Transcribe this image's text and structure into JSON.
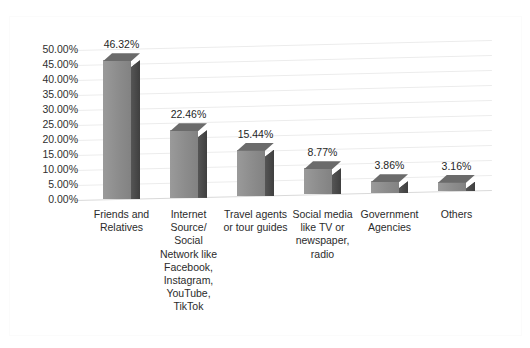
{
  "chart_data": {
    "type": "bar",
    "title": "",
    "subtitle": "",
    "xlabel": "",
    "ylabel": "",
    "categories": [
      "Friends and Relatives",
      "Internet Source/ Social Network like Facebook, Instagram, YouTube, TikTok",
      "Travel agents or tour guides",
      "Social media like TV or newspaper, radio",
      "Government Agencies",
      "Others"
    ],
    "values": [
      46.32,
      22.46,
      15.44,
      8.77,
      3.86,
      3.16
    ],
    "data_labels": [
      "46.32%",
      "22.46%",
      "15.44%",
      "8.77%",
      "3.86%",
      "3.16%"
    ],
    "ylim": [
      0,
      50
    ],
    "ytick_labels": [
      "50.00%",
      "45.00%",
      "40.00%",
      "35.00%",
      "30.00%",
      "25.00%",
      "20.00%",
      "15.00%",
      "10.00%",
      "5.00%",
      "0.00%"
    ],
    "ytick_values": [
      50,
      45,
      40,
      35,
      30,
      25,
      20,
      15,
      10,
      5,
      0
    ],
    "grid": true,
    "legend": false,
    "legend_position": "none",
    "style": "3d-column",
    "series": [
      {
        "name": "Share of respondents",
        "values": [
          46.32,
          22.46,
          15.44,
          8.77,
          3.86,
          3.16
        ]
      }
    ],
    "colors": {
      "bar_front": "#8e8e8e",
      "bar_side": "#4a4a4a",
      "bar_top": "#6b6b6b",
      "gridline": "#ececec",
      "text": "#2b2b2b",
      "background": "#ffffff",
      "frame_border": "#fbfbfb"
    }
  }
}
